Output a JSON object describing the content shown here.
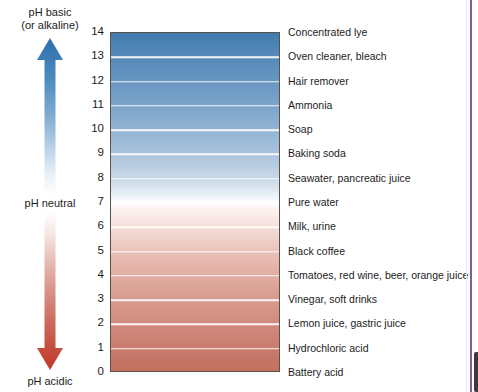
{
  "figure": {
    "axis": {
      "basic_label_line1": "pH basic",
      "basic_label_line2": "(or alkaline)",
      "neutral_label": "pH neutral",
      "acidic_label": "pH acidic"
    },
    "colors": {
      "basic_arrow": "#2f6fae",
      "acidic_arrow": "#c0392b",
      "bar_top": "#3f7bb0",
      "bar_middle": "#ffffff",
      "bar_bottom": "#c4705f",
      "separator": "#ffffff",
      "bar_border": "#5a5246",
      "page_edge_rule": "#7b5f95"
    }
  },
  "chart_data": {
    "type": "bar",
    "xlabel": "",
    "ylabel": "pH",
    "ylim": [
      0,
      14
    ],
    "grid": true,
    "legend": null,
    "categories": [
      "14",
      "13",
      "12",
      "11",
      "10",
      "9",
      "8",
      "7",
      "6",
      "5",
      "4",
      "3",
      "2",
      "1",
      "0"
    ],
    "values": [
      14,
      13,
      12,
      11,
      10,
      9,
      8,
      7,
      6,
      5,
      4,
      3,
      2,
      1,
      0
    ],
    "tick_labels": [
      "14",
      "13",
      "12",
      "11",
      "10",
      "9",
      "8",
      "7",
      "6",
      "5",
      "4",
      "3",
      "2",
      "1",
      "0"
    ],
    "annotations": [
      {
        "ph": 14,
        "label": "Concentrated lye"
      },
      {
        "ph": 13,
        "label": "Oven cleaner, bleach"
      },
      {
        "ph": 12,
        "label": "Hair remover"
      },
      {
        "ph": 11,
        "label": "Ammonia"
      },
      {
        "ph": 10,
        "label": "Soap"
      },
      {
        "ph": 9,
        "label": "Baking soda"
      },
      {
        "ph": 8,
        "label": "Seawater, pancreatic juice"
      },
      {
        "ph": 7,
        "label": "Pure water"
      },
      {
        "ph": 6,
        "label": "Milk, urine"
      },
      {
        "ph": 5,
        "label": "Black coffee"
      },
      {
        "ph": 4,
        "label": "Tomatoes, red wine, beer, orange juice"
      },
      {
        "ph": 3,
        "label": "Vinegar, soft drinks"
      },
      {
        "ph": 2,
        "label": "Lemon juice, gastric juice"
      },
      {
        "ph": 1,
        "label": "Hydrochloric acid"
      },
      {
        "ph": 0,
        "label": "Battery acid"
      }
    ]
  }
}
